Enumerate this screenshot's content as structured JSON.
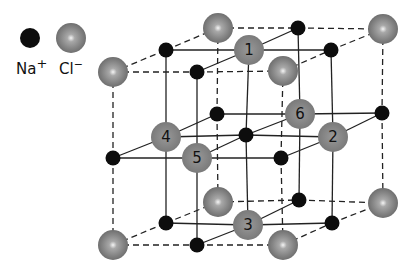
{
  "colors": {
    "na": "#0d0d0d",
    "cl": "#858585",
    "cl_highlight": "#f2f2f2",
    "line": "#222222",
    "background": "#ffffff"
  },
  "legend": {
    "na": {
      "label": "Na",
      "charge": "+",
      "cx": 30,
      "cy": 38,
      "r": 10
    },
    "cl": {
      "label": "Cl",
      "charge": "−",
      "cx": 71,
      "cy": 38,
      "r": 15
    }
  },
  "lattice": {
    "description": "NaCl rock-salt unit cell, 3x3x3 grid of alternating ions",
    "na_radius": 7.5,
    "cl_radius": 15,
    "layers": [
      [
        [
          {
            "x": 113,
            "y": 72,
            "ion": "cl"
          },
          {
            "x": 197,
            "y": 72,
            "ion": "na"
          },
          {
            "x": 283,
            "y": 71,
            "ion": "cl"
          }
        ],
        [
          {
            "x": 166,
            "y": 50,
            "ion": "na"
          },
          {
            "x": 249,
            "y": 50,
            "ion": "cl",
            "label": "1"
          },
          {
            "x": 331,
            "y": 50,
            "ion": "na"
          }
        ],
        [
          {
            "x": 218,
            "y": 28,
            "ion": "cl"
          },
          {
            "x": 298,
            "y": 28,
            "ion": "na"
          },
          {
            "x": 383,
            "y": 29,
            "ion": "cl"
          }
        ]
      ],
      [
        [
          {
            "x": 113,
            "y": 158,
            "ion": "na"
          },
          {
            "x": 197,
            "y": 158,
            "ion": "cl",
            "label": "5"
          },
          {
            "x": 281,
            "y": 158,
            "ion": "na"
          }
        ],
        [
          {
            "x": 166,
            "y": 137,
            "ion": "cl",
            "label": "4"
          },
          {
            "x": 246,
            "y": 135,
            "ion": "na"
          },
          {
            "x": 333,
            "y": 137,
            "ion": "cl",
            "label": "2"
          }
        ],
        [
          {
            "x": 217,
            "y": 114,
            "ion": "na"
          },
          {
            "x": 300,
            "y": 114,
            "ion": "cl",
            "label": "6"
          },
          {
            "x": 382,
            "y": 113,
            "ion": "na"
          }
        ]
      ],
      [
        [
          {
            "x": 113,
            "y": 245,
            "ion": "cl"
          },
          {
            "x": 197,
            "y": 245,
            "ion": "na"
          },
          {
            "x": 283,
            "y": 245,
            "ion": "cl"
          }
        ],
        [
          {
            "x": 166,
            "y": 223,
            "ion": "na"
          },
          {
            "x": 248,
            "y": 225,
            "ion": "cl",
            "label": "3"
          },
          {
            "x": 332,
            "y": 223,
            "ion": "na"
          }
        ],
        [
          {
            "x": 218,
            "y": 202,
            "ion": "cl"
          },
          {
            "x": 299,
            "y": 200,
            "ion": "na"
          },
          {
            "x": 383,
            "y": 203,
            "ion": "cl"
          }
        ]
      ]
    ]
  },
  "numbered_ions": [
    "1",
    "2",
    "3",
    "4",
    "5",
    "6"
  ]
}
